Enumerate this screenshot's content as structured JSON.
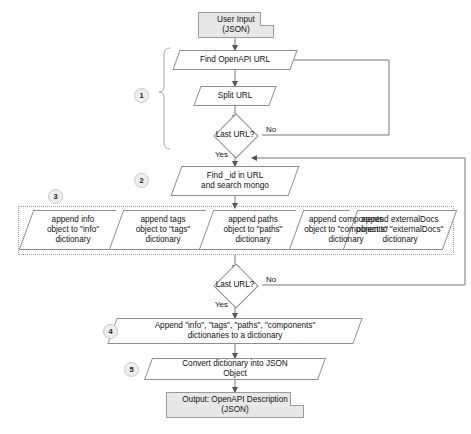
{
  "diagram": {
    "type": "flowchart",
    "colors": {
      "terminator_fill": "#e8e8e8",
      "node_fill": "#ffffff",
      "stroke": "#8d8d8d",
      "badge_fill": "#efefef",
      "text": "#111111"
    },
    "nodes": [
      {
        "id": "input",
        "shape": "document",
        "label": "User Input\n(JSON)"
      },
      {
        "id": "find_url",
        "shape": "parallelogram",
        "label": "Find OpenAPI URL"
      },
      {
        "id": "split_url",
        "shape": "parallelogram",
        "label": "Split URL"
      },
      {
        "id": "last_url_1",
        "shape": "diamond",
        "label": "Last URL?"
      },
      {
        "id": "find_id",
        "shape": "parallelogram",
        "label": "Find _id in URL\nand search mongo"
      },
      {
        "id": "append_info",
        "shape": "parallelogram",
        "label": "append info\nobject to \"info\"\ndictionary"
      },
      {
        "id": "append_tags",
        "shape": "parallelogram",
        "label": "append tags\nobject to \"tags\"\ndictionary"
      },
      {
        "id": "append_paths",
        "shape": "parallelogram",
        "label": "append paths\nobject to \"paths\"\ndictionary"
      },
      {
        "id": "append_components",
        "shape": "parallelogram",
        "label": "append components\nobject to \"components\"\ndictionary"
      },
      {
        "id": "append_external",
        "shape": "parallelogram",
        "label": "append externalDocs\nobject to \"externalDocs\"\ndictionary"
      },
      {
        "id": "last_url_2",
        "shape": "diamond",
        "label": "Last URL?"
      },
      {
        "id": "append_all",
        "shape": "parallelogram",
        "label": "Append \"info\", \"tags\", \"paths\", \"components\"\ndictionaries to a dictionary"
      },
      {
        "id": "convert",
        "shape": "parallelogram",
        "label": "Convert dictionary into JSON\nObject"
      },
      {
        "id": "output",
        "shape": "document",
        "label": "Output: OpenAPI Description\n(JSON)"
      }
    ],
    "badges": [
      {
        "id": "badge-1",
        "label": "1"
      },
      {
        "id": "badge-2",
        "label": "2"
      },
      {
        "id": "badge-3",
        "label": "3"
      },
      {
        "id": "badge-4",
        "label": "4"
      },
      {
        "id": "badge-5",
        "label": "5"
      }
    ],
    "edge_labels": {
      "loop1_no": "No",
      "loop1_yes": "Yes",
      "loop2_no": "No",
      "loop2_yes": "Yes"
    }
  }
}
